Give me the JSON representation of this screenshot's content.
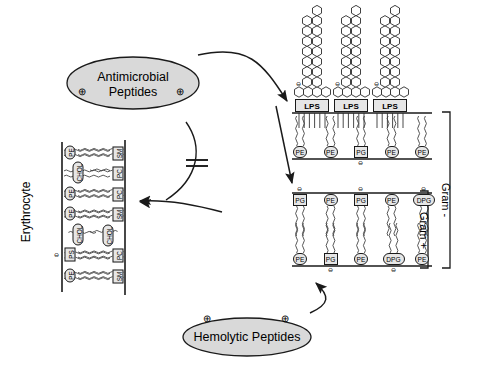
{
  "figure": {
    "type": "biological-schematic",
    "title_visible": false
  },
  "peptide_sources": {
    "antimicrobial": {
      "line1": "Antimicrobial",
      "line2": "Peptides",
      "charges": [
        "⊕",
        "⊕"
      ],
      "charge_symbol": "plus-circle"
    },
    "hemolytic": {
      "label": "Hemolytic Peptides",
      "charges": [
        "⊕",
        "⊕"
      ],
      "charge_symbol": "plus-circle"
    }
  },
  "erythrocyte": {
    "label": "Erythrocyte",
    "outer_leaflet_headgroups": [
      "SM",
      "PC",
      "PC",
      "SM",
      "CHOL",
      "PC",
      "SM"
    ],
    "inner_leaflet_headgroups": [
      "PE",
      "CHOL",
      "PE",
      "PE",
      "CHOL",
      "PS",
      "PE"
    ],
    "anionic_marker": "⊖",
    "anionic_headgroup": "PS",
    "cholesterol_label": "CHOL"
  },
  "bacteria": {
    "lps_label": "LPS",
    "lps_count": 3,
    "lps_charge": "⊖",
    "outer_membrane_inner_leaflet": [
      "PE",
      "PE",
      "PG",
      "PE",
      "PE"
    ],
    "inner_membrane_outer_leaflet": [
      "PG",
      "PE",
      "PG",
      "PE",
      "DPG"
    ],
    "inner_membrane_inner_leaflet": [
      "PE",
      "PG",
      "PE",
      "DPG",
      "PE"
    ],
    "headgroup_charge": "⊖",
    "brackets": [
      {
        "name": "gram-negative",
        "label": "Gram -"
      },
      {
        "name": "gram-positive",
        "label": "Gram +"
      }
    ]
  },
  "arrows": {
    "antimicrobial_to_bacteria": "curved-arrow-right",
    "antimicrobial_to_erythrocyte_blocked": "blocked-arrow",
    "blocked_symbol": "double-slash",
    "hemolytic_to_erythrocyte": "curved-arrow-left",
    "hemolytic_to_bacteria": "curved-arrow-right",
    "membrane_penetration": "straight-arrow-down"
  },
  "colors": {
    "stroke": "#1a1a1a",
    "ellipse_fill": "#d9d9d9",
    "headgroup_fill": "#e6e6e6",
    "background": "#ffffff"
  }
}
